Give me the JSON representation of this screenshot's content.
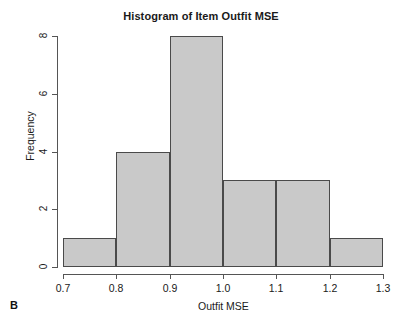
{
  "figure": {
    "panel_label": "B",
    "background_color": "#ffffff"
  },
  "chart_data": {
    "type": "bar",
    "title": "Histogram of Item Outfit MSE",
    "xlabel": "Outfit MSE",
    "ylabel": "Frequency",
    "bin_edges": [
      0.7,
      0.8,
      0.9,
      1.0,
      1.1,
      1.2,
      1.3
    ],
    "categories": [
      "0.7-0.8",
      "0.8-0.9",
      "0.9-1.0",
      "1.0-1.1",
      "1.1-1.2",
      "1.2-1.3"
    ],
    "values": [
      1,
      4,
      8,
      3,
      3,
      1
    ],
    "xlim": [
      0.7,
      1.3
    ],
    "ylim": [
      0,
      8
    ],
    "xticks": [
      "0.7",
      "0.8",
      "0.9",
      "1.0",
      "1.1",
      "1.2",
      "1.3"
    ],
    "xtick_values": [
      0.7,
      0.8,
      0.9,
      1.0,
      1.1,
      1.2,
      1.3
    ],
    "yticks": [
      "0",
      "2",
      "4",
      "6",
      "8"
    ],
    "ytick_values": [
      0,
      2,
      4,
      6,
      8
    ],
    "grid": false,
    "legend": null,
    "bar_fill_color": "#c9c9c9",
    "bar_border_color": "#4a4a4a",
    "axis_color": "#555555",
    "text_color": "#1a1a1a"
  }
}
